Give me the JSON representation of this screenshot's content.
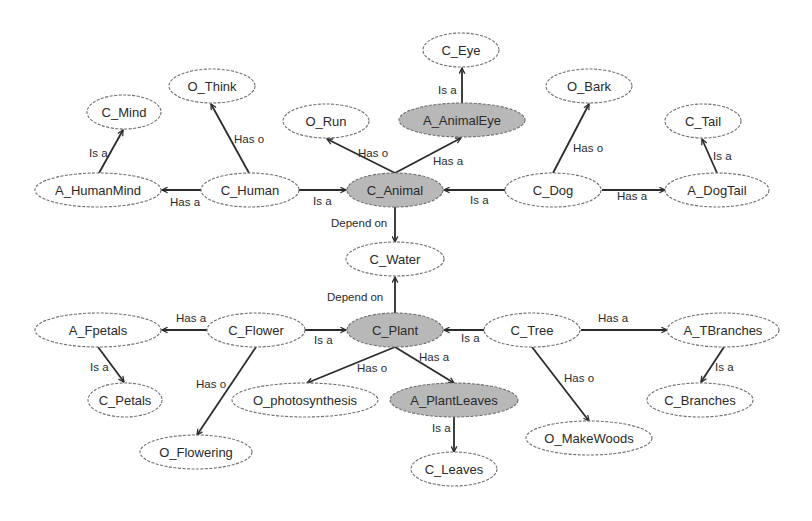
{
  "diagram": {
    "title": "",
    "colors": {
      "highlight_fill": "#b8b8b8",
      "plain_fill": "#ffffff",
      "edge": "#2b2b2b",
      "border": "#6e6e6e"
    },
    "nodes": [
      {
        "id": "C_Eye",
        "label": "C_Eye",
        "x": 461,
        "y": 50,
        "rx": 38,
        "ry": 17,
        "highlight": false
      },
      {
        "id": "A_AnimalEye",
        "label": "A_AnimalEye",
        "x": 462,
        "y": 120,
        "rx": 63,
        "ry": 17,
        "highlight": true
      },
      {
        "id": "O_Bark",
        "label": "O_Bark",
        "x": 589,
        "y": 86,
        "rx": 43,
        "ry": 17,
        "highlight": false
      },
      {
        "id": "C_Tail",
        "label": "C_Tail",
        "x": 703,
        "y": 121,
        "rx": 38,
        "ry": 17,
        "highlight": false
      },
      {
        "id": "O_Think",
        "label": "O_Think",
        "x": 212,
        "y": 86,
        "rx": 43,
        "ry": 17,
        "highlight": false
      },
      {
        "id": "C_Mind",
        "label": "C_Mind",
        "x": 124,
        "y": 112,
        "rx": 37,
        "ry": 17,
        "highlight": false
      },
      {
        "id": "O_Run",
        "label": "O_Run",
        "x": 326,
        "y": 121,
        "rx": 43,
        "ry": 17,
        "highlight": false
      },
      {
        "id": "A_HumanMind",
        "label": "A_HumanMind",
        "x": 98,
        "y": 190,
        "rx": 63,
        "ry": 17,
        "highlight": false
      },
      {
        "id": "C_Human",
        "label": "C_Human",
        "x": 250,
        "y": 190,
        "rx": 49,
        "ry": 17,
        "highlight": false
      },
      {
        "id": "C_Animal",
        "label": "C_Animal",
        "x": 395,
        "y": 190,
        "rx": 48,
        "ry": 17,
        "highlight": true
      },
      {
        "id": "C_Dog",
        "label": "C_Dog",
        "x": 553,
        "y": 190,
        "rx": 48,
        "ry": 17,
        "highlight": false
      },
      {
        "id": "A_DogTail",
        "label": "A_DogTail",
        "x": 717,
        "y": 190,
        "rx": 52,
        "ry": 17,
        "highlight": false
      },
      {
        "id": "C_Water",
        "label": "C_Water",
        "x": 395,
        "y": 259,
        "rx": 49,
        "ry": 17,
        "highlight": false
      },
      {
        "id": "A_Fpetals",
        "label": "A_Fpetals",
        "x": 98,
        "y": 330,
        "rx": 63,
        "ry": 17,
        "highlight": false
      },
      {
        "id": "C_Flower",
        "label": "C_Flower",
        "x": 256,
        "y": 330,
        "rx": 49,
        "ry": 17,
        "highlight": false
      },
      {
        "id": "C_Plant",
        "label": "C_Plant",
        "x": 395,
        "y": 330,
        "rx": 48,
        "ry": 17,
        "highlight": true
      },
      {
        "id": "C_Tree",
        "label": "C_Tree",
        "x": 532,
        "y": 330,
        "rx": 48,
        "ry": 17,
        "highlight": false
      },
      {
        "id": "A_TBranches",
        "label": "A_TBranches",
        "x": 723,
        "y": 330,
        "rx": 56,
        "ry": 17,
        "highlight": false
      },
      {
        "id": "C_Petals",
        "label": "C_Petals",
        "x": 125,
        "y": 400,
        "rx": 37,
        "ry": 17,
        "highlight": false
      },
      {
        "id": "O_photosynthesis",
        "label": "O_photosynthesis",
        "x": 305,
        "y": 400,
        "rx": 73,
        "ry": 17,
        "highlight": false
      },
      {
        "id": "A_PlantLeaves",
        "label": "A_PlantLeaves",
        "x": 454,
        "y": 400,
        "rx": 64,
        "ry": 17,
        "highlight": true
      },
      {
        "id": "C_Branches",
        "label": "C_Branches",
        "x": 700,
        "y": 400,
        "rx": 53,
        "ry": 17,
        "highlight": false
      },
      {
        "id": "O_MakeWoods",
        "label": "O_MakeWoods",
        "x": 589,
        "y": 438,
        "rx": 63,
        "ry": 17,
        "highlight": false
      },
      {
        "id": "O_Flowering",
        "label": "O_Flowering",
        "x": 196,
        "y": 452,
        "rx": 56,
        "ry": 17,
        "highlight": false
      },
      {
        "id": "C_Leaves",
        "label": "C_Leaves",
        "x": 454,
        "y": 469,
        "rx": 43,
        "ry": 17,
        "highlight": false
      }
    ],
    "edges": [
      {
        "from": "A_AnimalEye",
        "to": "C_Eye",
        "label": "Is a",
        "x1": 462,
        "y1": 103,
        "x2": 462,
        "y2": 68,
        "lx": 438,
        "ly": 90
      },
      {
        "from": "C_Animal",
        "to": "A_AnimalEye",
        "label": "Has a",
        "x1": 395,
        "y1": 173,
        "x2": 461,
        "y2": 138,
        "lx": 433,
        "ly": 161
      },
      {
        "from": "C_Animal",
        "to": "O_Run",
        "label": "Has o",
        "x1": 395,
        "y1": 173,
        "x2": 327,
        "y2": 139,
        "lx": 358,
        "ly": 153
      },
      {
        "from": "C_Human",
        "to": "O_Think",
        "label": "Has o",
        "x1": 249,
        "y1": 173,
        "x2": 211,
        "y2": 104,
        "lx": 234,
        "ly": 139
      },
      {
        "from": "A_HumanMind",
        "to": "C_Mind",
        "label": "Is a",
        "x1": 99,
        "y1": 173,
        "x2": 123,
        "y2": 130,
        "lx": 89,
        "ly": 153
      },
      {
        "from": "C_Human",
        "to": "A_HumanMind",
        "label": "Has a",
        "x1": 201,
        "y1": 190,
        "x2": 162,
        "y2": 190,
        "lx": 170,
        "ly": 202
      },
      {
        "from": "C_Human",
        "to": "C_Animal",
        "label": "Is a",
        "x1": 299,
        "y1": 190,
        "x2": 346,
        "y2": 190,
        "lx": 313,
        "ly": 201
      },
      {
        "from": "C_Dog",
        "to": "C_Animal",
        "label": "Is a",
        "x1": 505,
        "y1": 190,
        "x2": 444,
        "y2": 190,
        "lx": 470,
        "ly": 200
      },
      {
        "from": "C_Dog",
        "to": "O_Bark",
        "label": "Has o",
        "x1": 553,
        "y1": 173,
        "x2": 589,
        "y2": 104,
        "lx": 573,
        "ly": 148
      },
      {
        "from": "C_Dog",
        "to": "A_DogTail",
        "label": "Has a",
        "x1": 602,
        "y1": 190,
        "x2": 665,
        "y2": 190,
        "lx": 617,
        "ly": 196
      },
      {
        "from": "A_DogTail",
        "to": "C_Tail",
        "label": "Is a",
        "x1": 717,
        "y1": 173,
        "x2": 702,
        "y2": 139,
        "lx": 713,
        "ly": 156
      },
      {
        "from": "C_Animal",
        "to": "C_Water",
        "label": "Depend on",
        "x1": 395,
        "y1": 207,
        "x2": 395,
        "y2": 242,
        "lx": 331,
        "ly": 223
      },
      {
        "from": "C_Plant",
        "to": "C_Water",
        "label": "Depend on",
        "x1": 395,
        "y1": 313,
        "x2": 395,
        "y2": 277,
        "lx": 327,
        "ly": 297
      },
      {
        "from": "C_Flower",
        "to": "A_Fpetals",
        "label": "Has a",
        "x1": 207,
        "y1": 330,
        "x2": 162,
        "y2": 330,
        "lx": 176,
        "ly": 318
      },
      {
        "from": "C_Flower",
        "to": "C_Plant",
        "label": "Is a",
        "x1": 305,
        "y1": 330,
        "x2": 346,
        "y2": 330,
        "lx": 314,
        "ly": 340
      },
      {
        "from": "C_Tree",
        "to": "C_Plant",
        "label": "Is a",
        "x1": 484,
        "y1": 330,
        "x2": 444,
        "y2": 330,
        "lx": 461,
        "ly": 338
      },
      {
        "from": "C_Tree",
        "to": "A_TBranches",
        "label": "Has a",
        "x1": 581,
        "y1": 330,
        "x2": 667,
        "y2": 330,
        "lx": 598,
        "ly": 318
      },
      {
        "from": "A_TBranches",
        "to": "C_Branches",
        "label": "Is a",
        "x1": 724,
        "y1": 347,
        "x2": 701,
        "y2": 382,
        "lx": 715,
        "ly": 367
      },
      {
        "from": "A_Fpetals",
        "to": "C_Petals",
        "label": "Is a",
        "x1": 98,
        "y1": 347,
        "x2": 124,
        "y2": 382,
        "lx": 90,
        "ly": 367
      },
      {
        "from": "C_Flower",
        "to": "O_Flowering",
        "label": "Has o",
        "x1": 256,
        "y1": 347,
        "x2": 197,
        "y2": 435,
        "lx": 196,
        "ly": 384
      },
      {
        "from": "C_Plant",
        "to": "O_photosynthesis",
        "label": "Has o",
        "x1": 395,
        "y1": 347,
        "x2": 307,
        "y2": 383,
        "lx": 357,
        "ly": 368
      },
      {
        "from": "C_Plant",
        "to": "A_PlantLeaves",
        "label": "Has a",
        "x1": 395,
        "y1": 347,
        "x2": 454,
        "y2": 383,
        "lx": 419,
        "ly": 357
      },
      {
        "from": "A_PlantLeaves",
        "to": "C_Leaves",
        "label": "Is a",
        "x1": 454,
        "y1": 417,
        "x2": 454,
        "y2": 452,
        "lx": 432,
        "ly": 428
      },
      {
        "from": "C_Tree",
        "to": "O_MakeWoods",
        "label": "Has o",
        "x1": 532,
        "y1": 347,
        "x2": 589,
        "y2": 421,
        "lx": 564,
        "ly": 378
      }
    ]
  }
}
